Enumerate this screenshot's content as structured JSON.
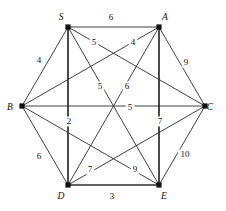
{
  "figure": {
    "type": "weighted-graph",
    "shape": "hexagon",
    "background_color": "#ffffff",
    "line_color": "#2b2b2b",
    "text_color": "#111111"
  },
  "graph_data": {
    "type": "graph",
    "directed": false,
    "complete": true,
    "node_count": 6,
    "edge_count": 15,
    "nodes": [
      {
        "id": "S",
        "label": "S",
        "x": 68,
        "y": 27,
        "label_x": 61,
        "label_y": 20
      },
      {
        "id": "A",
        "label": "A",
        "x": 159,
        "y": 27,
        "label_x": 165,
        "label_y": 20
      },
      {
        "id": "B",
        "label": "B",
        "x": 22,
        "y": 106,
        "label_x": 10,
        "label_y": 110
      },
      {
        "id": "C",
        "label": "C",
        "x": 205,
        "y": 106,
        "label_x": 210,
        "label_y": 110
      },
      {
        "id": "D",
        "label": "D",
        "x": 68,
        "y": 185,
        "label_x": 61,
        "label_y": 199
      },
      {
        "id": "E",
        "label": "E",
        "x": 159,
        "y": 185,
        "label_x": 164,
        "label_y": 199
      }
    ],
    "edges": [
      {
        "source": "S",
        "target": "A",
        "weight": 6,
        "label": "6",
        "label_x": 111,
        "label_y": 20,
        "heavy": false
      },
      {
        "source": "S",
        "target": "B",
        "weight": 4,
        "label": "4",
        "label_x": 39,
        "label_y": 63,
        "heavy": false
      },
      {
        "source": "S",
        "target": "C",
        "weight": 5,
        "label": "5",
        "label_x": 94,
        "label_y": 45,
        "heavy": false
      },
      {
        "source": "S",
        "target": "D",
        "weight": 2,
        "label": "2",
        "label_x": 69,
        "label_y": 124,
        "heavy": true
      },
      {
        "source": "S",
        "target": "E",
        "weight": 5,
        "label": "5",
        "label_x": 100,
        "label_y": 89,
        "heavy": false
      },
      {
        "source": "A",
        "target": "B",
        "weight": 4,
        "label": "4",
        "label_x": 133,
        "label_y": 45,
        "heavy": false
      },
      {
        "source": "A",
        "target": "C",
        "weight": 9,
        "label": "9",
        "label_x": 186,
        "label_y": 65,
        "heavy": false
      },
      {
        "source": "A",
        "target": "D",
        "weight": 6,
        "label": "6",
        "label_x": 127,
        "label_y": 89,
        "heavy": false
      },
      {
        "source": "A",
        "target": "E",
        "weight": 7,
        "label": "7",
        "label_x": 160,
        "label_y": 124,
        "heavy": true
      },
      {
        "source": "B",
        "target": "C",
        "weight": 5,
        "label": "5",
        "label_x": 130,
        "label_y": 110,
        "heavy": false
      },
      {
        "source": "B",
        "target": "D",
        "weight": 6,
        "label": "6",
        "label_x": 39,
        "label_y": 159,
        "heavy": false
      },
      {
        "source": "B",
        "target": "E",
        "weight": 9,
        "label": "9",
        "label_x": 135,
        "label_y": 172,
        "heavy": false
      },
      {
        "source": "C",
        "target": "D",
        "weight": 7,
        "label": "7",
        "label_x": 90,
        "label_y": 172,
        "heavy": false
      },
      {
        "source": "C",
        "target": "E",
        "weight": 10,
        "label": "10",
        "label_x": 185,
        "label_y": 157,
        "heavy": false
      },
      {
        "source": "D",
        "target": "E",
        "weight": 3,
        "label": "3",
        "label_x": 112,
        "label_y": 199,
        "heavy": true
      }
    ]
  }
}
